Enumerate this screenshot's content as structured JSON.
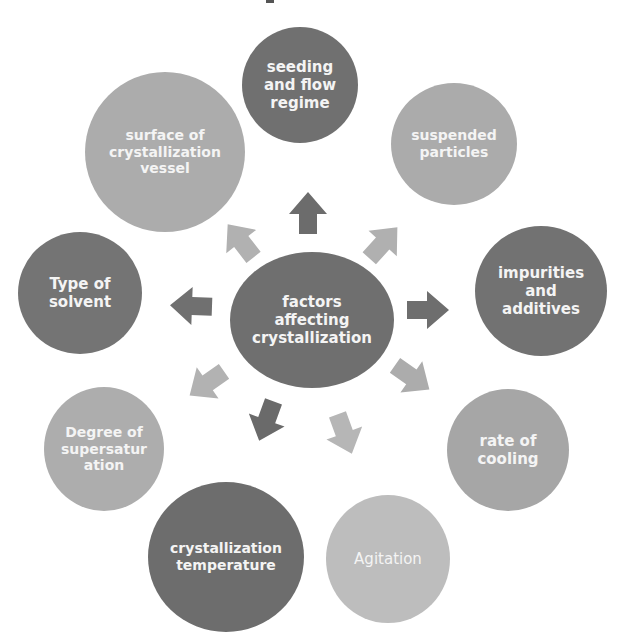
{
  "diagram": {
    "type": "radial-hub-and-spoke",
    "center": {
      "label": "factors\naffecting\ncrystallization",
      "shade": "#6f6f6f"
    },
    "factors": [
      {
        "id": "seeding",
        "label": "seeding\nand flow\nregime",
        "shade": "#707070",
        "arrow_shade": "#6c6c6c"
      },
      {
        "id": "suspended",
        "label": "suspended\nparticles",
        "shade": "#ababab",
        "arrow_shade": "#b0b0b0"
      },
      {
        "id": "impurities",
        "label": "impurities\nand\nadditives",
        "shade": "#727272",
        "arrow_shade": "#6e6e6e"
      },
      {
        "id": "cooling",
        "label": "rate of\ncooling",
        "shade": "#a6a6a6",
        "arrow_shade": "#acacac"
      },
      {
        "id": "agitation",
        "label": "Agitation",
        "shade": "#bdbdbd",
        "arrow_shade": "#b6b6b6"
      },
      {
        "id": "temperature",
        "label": "crystallization\ntemperature",
        "shade": "#6d6d6d",
        "arrow_shade": "#6a6a6a"
      },
      {
        "id": "supersaturation",
        "label": "Degree of\nsupersatur\nation",
        "shade": "#adadad",
        "arrow_shade": "#b2b2b2"
      },
      {
        "id": "solvent",
        "label": "Type of\nsolvent",
        "shade": "#747474",
        "arrow_shade": "#707070"
      },
      {
        "id": "surface",
        "label": "surface of\ncrystallization\nvessel",
        "shade": "#acacac",
        "arrow_shade": "#b1b1b1"
      }
    ]
  }
}
